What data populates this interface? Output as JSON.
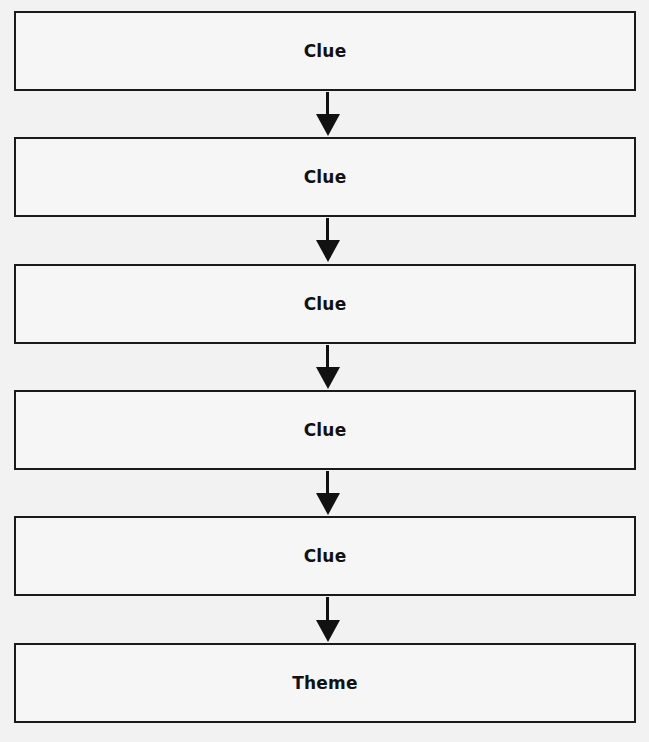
{
  "diagram": {
    "type": "flowchart",
    "direction": "top-to-bottom",
    "nodes": [
      {
        "label": "Clue"
      },
      {
        "label": "Clue"
      },
      {
        "label": "Clue"
      },
      {
        "label": "Clue"
      },
      {
        "label": "Clue"
      },
      {
        "label": "Theme"
      }
    ],
    "edges": [
      {
        "from": 0,
        "to": 1
      },
      {
        "from": 1,
        "to": 2
      },
      {
        "from": 2,
        "to": 3
      },
      {
        "from": 3,
        "to": 4
      },
      {
        "from": 4,
        "to": 5
      }
    ],
    "colors": {
      "stroke": "#1a1a1a",
      "background": "#f2f2f2"
    }
  }
}
